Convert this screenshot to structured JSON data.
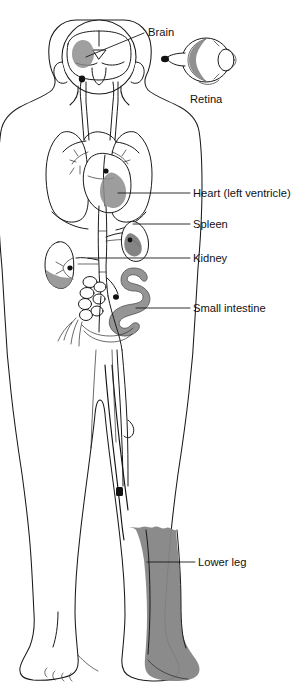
{
  "figure": {
    "background_color": "#ffffff",
    "line_color": "#1a1a1a",
    "shade_color": "#808080",
    "shade_color_light": "#999999",
    "shade_color_dark": "#6e6e6e",
    "width": 308,
    "height": 694
  },
  "labels": [
    {
      "id": "brain",
      "text": "Brain",
      "text_x": 148,
      "text_y": 36,
      "leader_from_x": 144,
      "leader_from_y": 33,
      "leader_to_x": 86,
      "leader_to_y": 57,
      "anchor": "start"
    },
    {
      "id": "retina",
      "text": "Retina",
      "text_x": 190,
      "text_y": 103,
      "leader_from_x": null,
      "leader_from_y": null,
      "leader_to_x": null,
      "leader_to_y": null,
      "anchor": "start"
    },
    {
      "id": "heart-left-ventricle",
      "text": "Heart (left ventricle)",
      "text_x": 193,
      "text_y": 197,
      "leader_from_x": 190,
      "leader_from_y": 193,
      "leader_to_x": 118,
      "leader_to_y": 193,
      "anchor": "start"
    },
    {
      "id": "spleen",
      "text": "Spleen",
      "text_x": 193,
      "text_y": 228,
      "leader_from_x": 190,
      "leader_from_y": 224,
      "leader_to_x": 133,
      "leader_to_y": 224,
      "anchor": "start"
    },
    {
      "id": "kidney",
      "text": "Kidney",
      "text_x": 193,
      "text_y": 262,
      "leader_from_x": 190,
      "leader_from_y": 258,
      "leader_to_x": 88,
      "leader_to_y": 258,
      "anchor": "start"
    },
    {
      "id": "small-intestine",
      "text": "Small intestine",
      "text_x": 193,
      "text_y": 312,
      "leader_from_x": 190,
      "leader_from_y": 308,
      "leader_to_x": 136,
      "leader_to_y": 308,
      "anchor": "start"
    },
    {
      "id": "lower-leg",
      "text": "Lower leg",
      "text_x": 198,
      "text_y": 566,
      "leader_from_x": 195,
      "leader_from_y": 562,
      "leader_to_x": 147,
      "leader_to_y": 562,
      "anchor": "start"
    }
  ],
  "regions": [
    {
      "id": "brain-infarct",
      "name": "shaded brain region",
      "shade": "#8a8a8a"
    },
    {
      "id": "retina-shade",
      "name": "shaded retina region",
      "shade": "#7d7d7d"
    },
    {
      "id": "heart-ventricle-shade",
      "name": "shaded left ventricle",
      "shade": "#8c8c8c"
    },
    {
      "id": "spleen-shade",
      "name": "shaded spleen",
      "shade": "#6f6f6f"
    },
    {
      "id": "kidney-shade",
      "name": "shaded kidney pole",
      "shade": "#8a8a8a"
    },
    {
      "id": "small-intestine-shade",
      "name": "shaded small intestine loop",
      "shade": "#8a8a8a"
    },
    {
      "id": "lower-leg-shade",
      "name": "shaded lower leg and foot",
      "shade": "#858585"
    }
  ]
}
